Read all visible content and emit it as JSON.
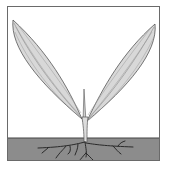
{
  "figure": {
    "colors": {
      "background": "#ffffff",
      "frame_border": "#6a6a6a",
      "soil": "#8c8c8c",
      "soil_line": "#444444",
      "leaf_fill": "#d8d8d8",
      "leaf_stroke": "#555555",
      "leaf_vein": "#8a8a8a",
      "root": "#2a2a2a"
    },
    "parts": [
      "left-leaf",
      "right-leaf",
      "shoot-tip",
      "stem",
      "soil",
      "roots"
    ]
  },
  "caption": {
    "text": ""
  }
}
